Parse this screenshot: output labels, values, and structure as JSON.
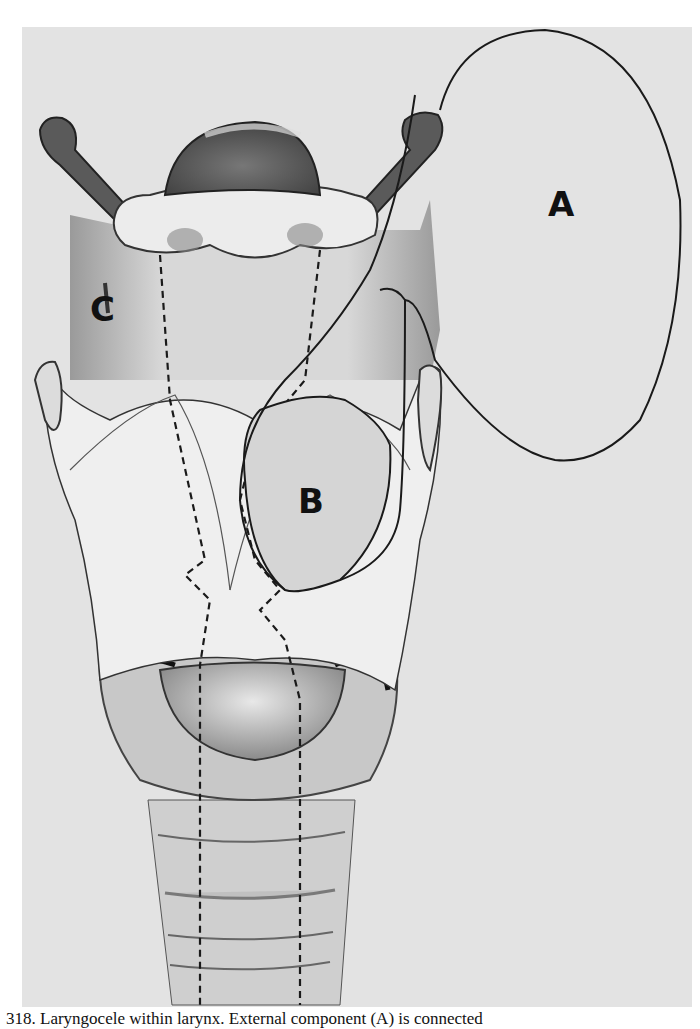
{
  "figure": {
    "labels": {
      "a": "A",
      "b": "B",
      "c": "C"
    },
    "colors": {
      "panel_background": "#e3e3e3",
      "page_background": "#ffffff",
      "outline": "#1a1a1a",
      "cartilage_light": "#f2f2f2",
      "shading_dark": "#555555"
    }
  },
  "caption": {
    "text": "318. Laryngocele within larynx. External component (A) is connected"
  }
}
